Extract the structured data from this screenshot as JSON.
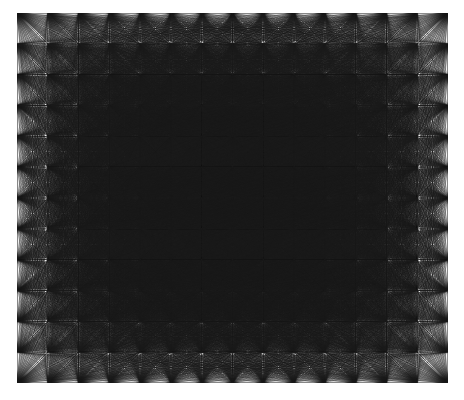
{
  "figure": {
    "title": "",
    "caption": "",
    "type": "geometric-line-figure",
    "background_color": "#ffffff",
    "plot_background_color": "#f2f2f2",
    "line_color": "#1a1a1a",
    "canvas_width": 464,
    "canvas_height": 400,
    "plot_left": 17,
    "plot_top": 13,
    "plot_right": 448,
    "plot_bottom": 383,
    "plot_width": 431,
    "plot_height": 370
  },
  "chart_data": {
    "type": "scatter",
    "title": "",
    "subtitle": "",
    "xlabel": "",
    "ylabel": "",
    "grid": true,
    "legend": null,
    "lattice": {
      "columns": 15,
      "rows": 13,
      "x_spacing": 30.8,
      "y_spacing": 30.8,
      "origin_x": 17,
      "origin_y": 13,
      "total_points": 195
    },
    "segments": {
      "rule": "connect-every-pair",
      "count": 18915,
      "line_width": 0.35,
      "opacity": 0.55,
      "color": "#1a1a1a"
    },
    "xlim": [
      0,
      14
    ],
    "ylim": [
      0,
      12
    ],
    "x_tick_labels": [],
    "y_tick_labels": [],
    "annotations": []
  },
  "render": {
    "antialias": true,
    "supersample": 2
  }
}
